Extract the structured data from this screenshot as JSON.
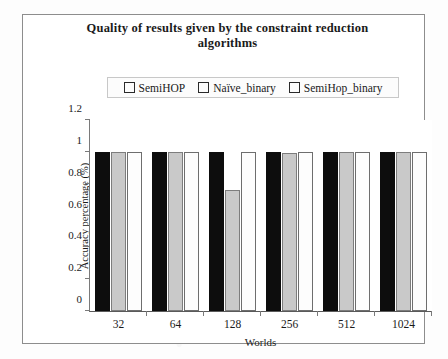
{
  "chart_data": {
    "type": "bar",
    "title": "Quality of results given by the constraint reduction algorithms",
    "title_line1": "Quality of results given by the constraint reduction",
    "title_line2": "algorithms",
    "xlabel": "Worlds",
    "ylabel": "Accuracy percentage (%)",
    "categories": [
      "32",
      "64",
      "128",
      "256",
      "512",
      "1024"
    ],
    "ylim": [
      0,
      1.2
    ],
    "yticks": [
      "0",
      "0.2",
      "0.4",
      "0.6",
      "0.8",
      "1",
      "1.2"
    ],
    "ytick_values": [
      0,
      0.2,
      0.4,
      0.6,
      0.8,
      1,
      1.2
    ],
    "grid": false,
    "legend_position": "top-center",
    "series": [
      {
        "name": "SemiHOP",
        "color": "#0d0d0d",
        "values": [
          1,
          1,
          1,
          1,
          1,
          1
        ]
      },
      {
        "name": "Naïve_binary",
        "color": "#c9c9c9",
        "values": [
          1,
          1,
          0.76,
          0.99,
          1,
          1
        ]
      },
      {
        "name": "SemiHop_binary",
        "color": "#fdfdfd",
        "values": [
          1,
          1,
          1,
          1,
          1,
          1
        ]
      }
    ]
  }
}
